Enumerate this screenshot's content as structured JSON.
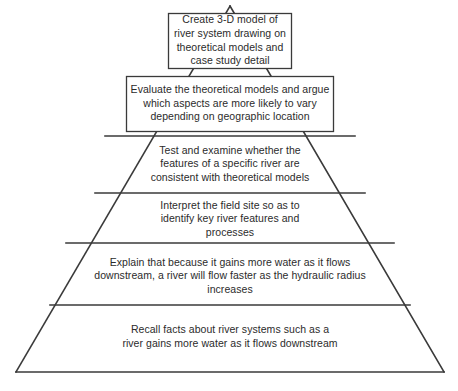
{
  "diagram": {
    "type": "learning-objectives-pyramid",
    "stroke_color": "#3a3a3a",
    "text_color": "#2b2b2b",
    "background_color": "#ffffff",
    "tiers": [
      {
        "level": 1,
        "shape": "rectangle",
        "text": "Create 3-D model of\nriver system drawing on\ntheoretical models and\ncase study detail"
      },
      {
        "level": 2,
        "shape": "rectangle",
        "text": "Evaluate the theoretical models and argue\nwhich aspects are more likely to vary\ndepending on geographic location"
      },
      {
        "level": 3,
        "shape": "trapezoid",
        "text": "Test and examine whether the\nfeatures of a specific river are\nconsistent with theoretical models"
      },
      {
        "level": 4,
        "shape": "trapezoid",
        "text": "Interpret the field site so as to\nidentify key river features and\nprocesses"
      },
      {
        "level": 5,
        "shape": "trapezoid",
        "text": "Explain that because it gains more water as it flows\ndownstream, a river will flow faster as the hydraulic radius\nincreases"
      },
      {
        "level": 6,
        "shape": "trapezoid",
        "text": "Recall facts about river systems such as a\nriver gains more water as it flows downstream"
      }
    ]
  }
}
